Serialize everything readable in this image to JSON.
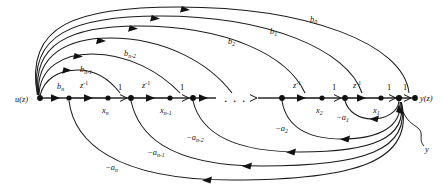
{
  "figure": {
    "name": "signal-flow-graph",
    "background_color": "#ffffff",
    "line_color": "#111111",
    "width": 443,
    "height": 186
  },
  "terminals": {
    "input": {
      "label": "u(z)",
      "base": "u",
      "paren": "(z)"
    },
    "output": {
      "label": "y(z)",
      "base": "y",
      "paren": "(z)"
    }
  },
  "annotation": {
    "label": "y",
    "name": "output-node-callout"
  },
  "ellipsis": {
    "text": "."
  },
  "delays": [
    {
      "id": "delay-n",
      "base": "z",
      "exponent": "-1"
    },
    {
      "id": "delay-n-1",
      "base": "z",
      "exponent": "-1"
    },
    {
      "id": "delay-2",
      "base": "z",
      "exponent": "-1"
    },
    {
      "id": "delay-1",
      "base": "z",
      "exponent": "-1"
    }
  ],
  "state_nodes": [
    {
      "id": "state-xn",
      "base": "x",
      "sub": "n"
    },
    {
      "id": "state-xn-1",
      "base": "x",
      "sub": "n-1"
    },
    {
      "id": "state-x2",
      "base": "x",
      "sub": "2"
    },
    {
      "id": "state-x1",
      "base": "x",
      "sub": "1"
    }
  ],
  "unity_gains": [
    {
      "id": "unity-gain-xn",
      "label": "1"
    },
    {
      "id": "unity-gain-xn-1",
      "label": "1"
    },
    {
      "id": "unity-gain-x2",
      "label": "1"
    },
    {
      "id": "unity-gain-x1",
      "label": "1"
    },
    {
      "id": "unity-gain-out",
      "label": "1"
    }
  ],
  "feedforward_gains": [
    {
      "id": "gain-bn",
      "base": "b",
      "sub": "n",
      "label": "b_n"
    },
    {
      "id": "gain-bn-1",
      "base": "b",
      "sub": "n-1",
      "label": "b_{n-1}"
    },
    {
      "id": "gain-bn-2",
      "base": "b",
      "sub": "n-2",
      "label": "b_{n-2}"
    },
    {
      "id": "gain-b2",
      "base": "b",
      "sub": "2",
      "label": "b_2"
    },
    {
      "id": "gain-b1",
      "base": "b",
      "sub": "1",
      "label": "b_1"
    },
    {
      "id": "gain-b0",
      "base": "b",
      "sub": "0",
      "label": "b_0"
    }
  ],
  "feedback_gains": [
    {
      "id": "gain-a1",
      "prefix": "−",
      "base": "a",
      "sub": "1",
      "label": "-a_1"
    },
    {
      "id": "gain-a2",
      "prefix": "−",
      "base": "a",
      "sub": "2",
      "label": "-a_2"
    },
    {
      "id": "gain-an-2",
      "prefix": "−",
      "base": "a",
      "sub": "n-2",
      "label": "-a_{n-2}"
    },
    {
      "id": "gain-an-1",
      "prefix": "−",
      "base": "a",
      "sub": "n-1",
      "label": "-a_{n-1}"
    },
    {
      "id": "gain-an",
      "prefix": "−",
      "base": "a",
      "sub": "n",
      "label": "-a_n"
    }
  ]
}
